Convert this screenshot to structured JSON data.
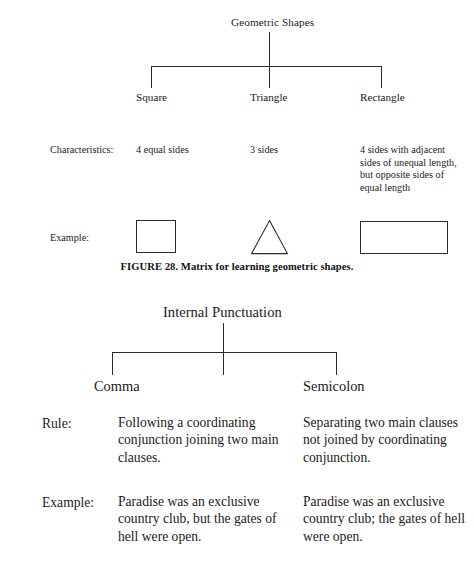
{
  "figure_top": {
    "root_label": "Geometric Shapes",
    "columns": [
      "Square",
      "Triangle",
      "Rectangle"
    ],
    "rows": [
      {
        "label": "Characteristics:",
        "cells": [
          "4 equal sides",
          "3 sides",
          "4 sides with adjacent sides of unequal length, but opposite sides of equal length"
        ]
      },
      {
        "label": "Example:",
        "cells": [
          "square-shape",
          "triangle-shape",
          "rectangle-shape"
        ]
      }
    ],
    "caption": "FIGURE 28. Matrix for learning geometric shapes."
  },
  "figure_bottom": {
    "root_label": "Internal Punctuation",
    "columns": [
      "Comma",
      "Semicolon"
    ],
    "rows": [
      {
        "label": "Rule:",
        "cells": [
          "Following a coordinating conjunction joining two main clauses.",
          "Separating two main clauses not joined by coordinating conjunction."
        ]
      },
      {
        "label": "Example:",
        "cells": [
          "Paradise was an exclusive country club, but the gates of hell were open.",
          "Paradise was an exclusive country club; the gates of hell were open."
        ]
      }
    ]
  },
  "colors": {
    "ink": "#1a1a1a",
    "rule": "#2b2b2b",
    "paper": "#ffffff"
  }
}
